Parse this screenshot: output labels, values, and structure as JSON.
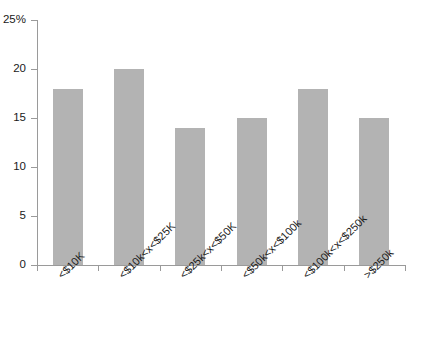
{
  "chart_data": {
    "type": "bar",
    "title": "",
    "subtitle": "",
    "xlabel": "",
    "ylabel": "",
    "categories": [
      "<$10K",
      "<$10k<x<$25K",
      "<$25k<x<$50K",
      "<$50k<x<$100k",
      "<$100k<x<$250k",
      ">$250k"
    ],
    "values": [
      18,
      20,
      14,
      15,
      18,
      15
    ],
    "ylim": [
      0,
      25
    ],
    "ytick_values": [
      0,
      5,
      10,
      15,
      20,
      25
    ],
    "ytick_labels": [
      "0",
      "5",
      "10",
      "15",
      "20",
      "25%"
    ],
    "grid": false,
    "legend": false,
    "bar_color": "#b3b3b3",
    "axis_color": "#9a9a9a",
    "background_color": "#ffffff",
    "xtick_label_rotation": "-45"
  }
}
